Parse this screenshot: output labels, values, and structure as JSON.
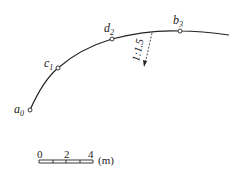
{
  "diagram": {
    "type": "curved embankment plan",
    "points": [
      {
        "id": "a0",
        "label": "a",
        "sub": "0",
        "x": 30,
        "y": 110
      },
      {
        "id": "c1",
        "label": "c",
        "sub": "1",
        "x": 58,
        "y": 68
      },
      {
        "id": "d2",
        "label": "d",
        "sub": "2",
        "x": 112,
        "y": 39
      },
      {
        "id": "b3",
        "label": "b",
        "sub": "3",
        "x": 180,
        "y": 31
      }
    ],
    "slope": {
      "label": "1:1.5"
    },
    "scale_bar": {
      "ticks": [
        "0",
        "2",
        "4"
      ],
      "unit": "(m)"
    },
    "colors": {
      "line": "#222222",
      "background": "#ffffff"
    }
  }
}
